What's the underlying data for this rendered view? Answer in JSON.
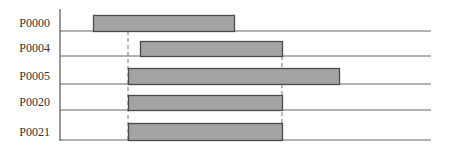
{
  "diagram": {
    "type": "gantt-timeline",
    "colors": {
      "bar_fill": "#a4a4a4",
      "bar_stroke": "#4a4a4a",
      "line": "#666666",
      "dashed": "#777777",
      "text": "#333333"
    },
    "axis": {
      "x": 60,
      "y_top": 9,
      "y_bottom": 141,
      "line_end_x": 431
    },
    "rows": [
      {
        "label": "P0000",
        "baseline_y": 31,
        "bar_top": 15,
        "bar_start": 93,
        "bar_end": 234
      },
      {
        "label": "P0004",
        "baseline_y": 56,
        "bar_top": 41,
        "bar_start": 140,
        "bar_end": 282
      },
      {
        "label": "P0005",
        "baseline_y": 84,
        "bar_top": 68,
        "bar_start": 128,
        "bar_end": 339
      },
      {
        "label": "P0020",
        "baseline_y": 110,
        "bar_top": 95,
        "bar_start": 128,
        "bar_end": 282
      },
      {
        "label": "P0021",
        "baseline_y": 140,
        "bar_top": 123,
        "bar_start": 128,
        "bar_end": 282
      }
    ],
    "dashed_markers": [
      {
        "x": 128,
        "y_top": 31,
        "y_bottom": 140
      },
      {
        "x": 282,
        "y_top": 56,
        "y_bottom": 140
      }
    ]
  }
}
